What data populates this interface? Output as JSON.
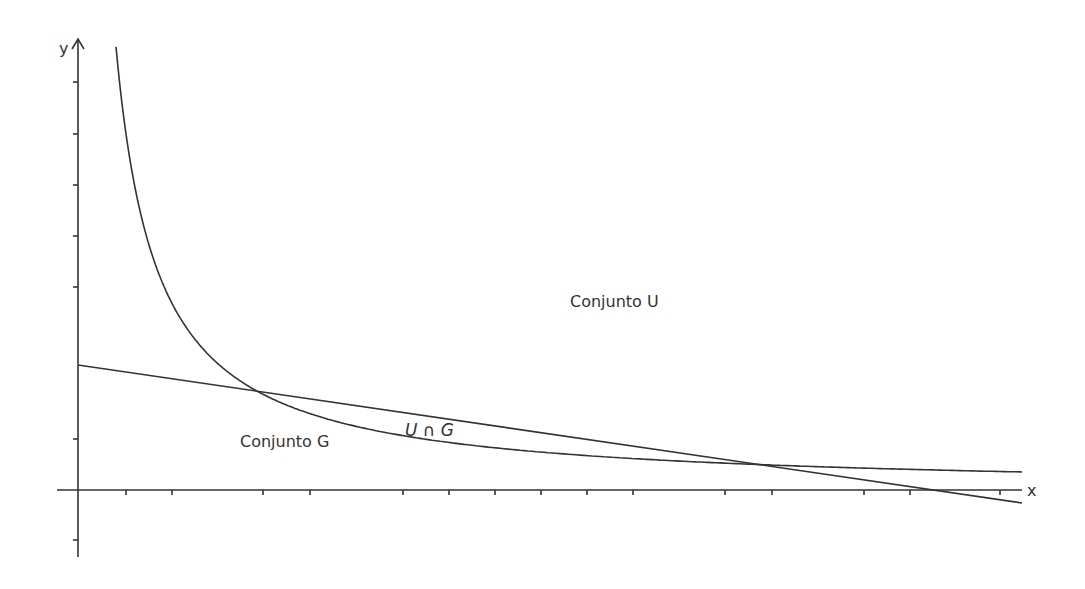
{
  "diagram": {
    "type": "set-region-plot",
    "stroke_color": "#333333",
    "background": "#ffffff",
    "axes": {
      "x_label": "x",
      "y_label": "y",
      "origin_px": [
        78,
        490
      ],
      "x_axis_px": {
        "start": 57,
        "end": 1022
      },
      "y_axis_px": {
        "top": 39,
        "bottom": 557
      },
      "x_ticks_px": [
        126,
        172,
        263,
        310,
        403,
        449,
        495,
        541,
        587,
        633,
        725,
        772,
        864,
        910,
        1000
      ],
      "y_ticks_px": [
        82,
        134,
        185,
        236,
        287,
        439,
        540
      ]
    },
    "labels": {
      "set_u": "Conjunto U",
      "set_g": "Conjunto G",
      "intersection": "U ∩ G"
    }
  },
  "chart_data": {
    "type": "line",
    "title": "",
    "xlabel": "x",
    "ylabel": "y",
    "grid": false,
    "legend": null,
    "series": [
      {
        "name": "decreasing curve (hyperbola-like)",
        "description": "y = c + k/(x - x0) in pixel space",
        "params_px": {
          "x0": 75,
          "k": -18222,
          "c": 491.2
        },
        "x_range_px": [
          116,
          1022
        ]
      },
      {
        "name": "decreasing straight line",
        "points_px": [
          [
            78,
            365
          ],
          [
            1022,
            503
          ]
        ]
      }
    ],
    "intersections_px": [
      [
        255,
        390
      ],
      [
        760,
        464
      ]
    ],
    "line_x_intercept_px": [
      935,
      490
    ],
    "annotations": [
      {
        "text": "Conjunto U",
        "pos_px": [
          570,
          307
        ]
      },
      {
        "text": "Conjunto G",
        "pos_px": [
          240,
          447
        ]
      },
      {
        "text": "U ∩ G",
        "pos_px": [
          405,
          436
        ]
      }
    ]
  }
}
